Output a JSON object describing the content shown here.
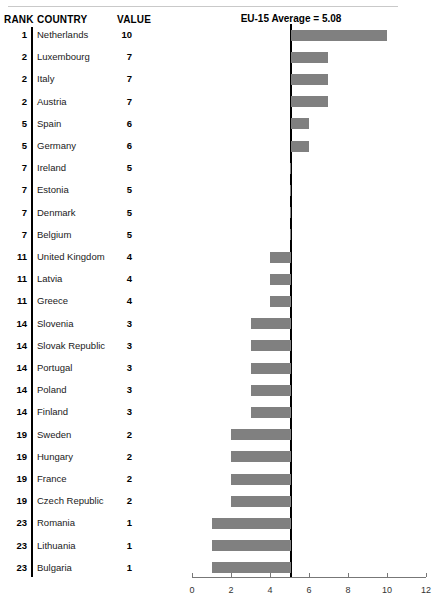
{
  "table": {
    "headers": {
      "rank": "RANK",
      "country": "COUNTRY",
      "value": "VALUE"
    },
    "rows": [
      {
        "rank": "1",
        "country": "Netherlands",
        "value": "10"
      },
      {
        "rank": "2",
        "country": "Luxembourg",
        "value": "7"
      },
      {
        "rank": "2",
        "country": "Italy",
        "value": "7"
      },
      {
        "rank": "2",
        "country": "Austria",
        "value": "7"
      },
      {
        "rank": "5",
        "country": "Spain",
        "value": "6"
      },
      {
        "rank": "5",
        "country": "Germany",
        "value": "6"
      },
      {
        "rank": "7",
        "country": "Ireland",
        "value": "5"
      },
      {
        "rank": "7",
        "country": "Estonia",
        "value": "5"
      },
      {
        "rank": "7",
        "country": "Denmark",
        "value": "5"
      },
      {
        "rank": "7",
        "country": "Belgium",
        "value": "5"
      },
      {
        "rank": "11",
        "country": "United Kingdom",
        "value": "4"
      },
      {
        "rank": "11",
        "country": "Latvia",
        "value": "4"
      },
      {
        "rank": "11",
        "country": "Greece",
        "value": "4"
      },
      {
        "rank": "14",
        "country": "Slovenia",
        "value": "3"
      },
      {
        "rank": "14",
        "country": "Slovak Republic",
        "value": "3"
      },
      {
        "rank": "14",
        "country": "Portugal",
        "value": "3"
      },
      {
        "rank": "14",
        "country": "Poland",
        "value": "3"
      },
      {
        "rank": "14",
        "country": "Finland",
        "value": "3"
      },
      {
        "rank": "19",
        "country": "Sweden",
        "value": "2"
      },
      {
        "rank": "19",
        "country": "Hungary",
        "value": "2"
      },
      {
        "rank": "19",
        "country": "France",
        "value": "2"
      },
      {
        "rank": "19",
        "country": "Czech Republic",
        "value": "2"
      },
      {
        "rank": "23",
        "country": "Romania",
        "value": "1"
      },
      {
        "rank": "23",
        "country": "Lithuania",
        "value": "1"
      },
      {
        "rank": "23",
        "country": "Bulgaria",
        "value": "1"
      }
    ]
  },
  "chart_data": {
    "type": "bar",
    "orientation": "horizontal",
    "title": "EU-15 Average = 5.08",
    "xlabel": "",
    "ylabel": "",
    "baseline": 5.08,
    "baseline_label": "EU-15 Average = 5.08",
    "xlim": [
      0,
      12
    ],
    "xticks": [
      0,
      2,
      4,
      6,
      8,
      10,
      12
    ],
    "xtick_labels": [
      "0",
      "2",
      "4",
      "6",
      "8",
      "10",
      "12"
    ],
    "grid": false,
    "legend": false,
    "bar_color": "#808080",
    "baseline_color": "#000000",
    "categories": [
      "Netherlands",
      "Luxembourg",
      "Italy",
      "Austria",
      "Spain",
      "Germany",
      "Ireland",
      "Estonia",
      "Denmark",
      "Belgium",
      "United Kingdom",
      "Latvia",
      "Greece",
      "Slovenia",
      "Slovak Republic",
      "Portugal",
      "Poland",
      "Finland",
      "Sweden",
      "Hungary",
      "France",
      "Czech Republic",
      "Romania",
      "Lithuania",
      "Bulgaria"
    ],
    "values": [
      10,
      7,
      7,
      7,
      6,
      6,
      5,
      5,
      5,
      5,
      4,
      4,
      4,
      3,
      3,
      3,
      3,
      3,
      2,
      2,
      2,
      2,
      1,
      1,
      1
    ],
    "ranks": [
      1,
      2,
      2,
      2,
      5,
      5,
      7,
      7,
      7,
      7,
      11,
      11,
      11,
      14,
      14,
      14,
      14,
      14,
      19,
      19,
      19,
      19,
      23,
      23,
      23
    ]
  },
  "axis": {
    "tick_labels": [
      "0",
      "2",
      "4",
      "6",
      "8",
      "10",
      "12"
    ]
  }
}
